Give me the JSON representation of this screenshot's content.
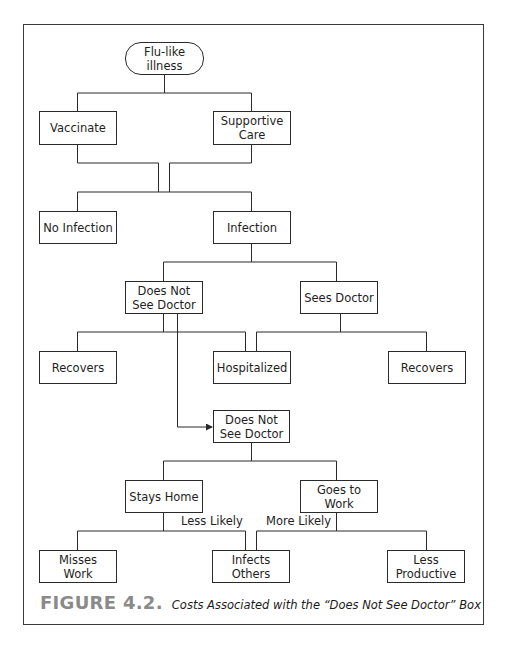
{
  "figure": {
    "number": "FIGURE 4.2.",
    "caption": "Costs Associated with the “Does Not See Doctor” Box",
    "colors": {
      "line": "#2a2a2a",
      "figure_number": "#8a8a8a",
      "text": "#1e1e1e"
    }
  },
  "nodes": {
    "root": "Flu-like illness",
    "vaccinate": "Vaccinate",
    "supportive_care": "Supportive Care",
    "no_infection": "No Infection",
    "infection": "Infection",
    "does_not_see_doctor": "Does Not See Doctor",
    "sees_doctor": "Sees Doctor",
    "recovers_left": "Recovers",
    "hospitalized": "Hospitalized",
    "recovers_right": "Recovers",
    "does_not_see_doctor_2": "Does Not See Doctor",
    "stays_home": "Stays Home",
    "goes_to_work": "Goes to Work",
    "misses_work": "Misses Work",
    "infects_others": "Infects Others",
    "less_productive": "Less Productive"
  },
  "edge_labels": {
    "less_likely": "Less Likely",
    "more_likely": "More Likely"
  }
}
